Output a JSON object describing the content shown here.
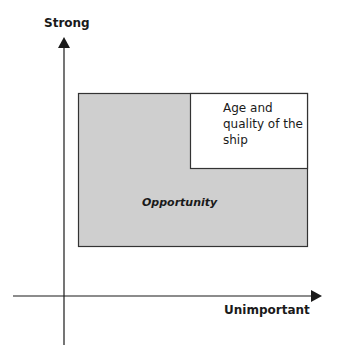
{
  "diagram": {
    "y_axis": {
      "label": "Strong"
    },
    "x_axis": {
      "label": "Unimportant"
    },
    "regions": [
      {
        "name": "opportunity",
        "label": "Opportunity",
        "fill": "#cfcfcf"
      },
      {
        "name": "age-quality",
        "label": "Age and quality of the ship",
        "fill": "#ffffff"
      }
    ],
    "colors": {
      "axis": "#1a1a1a",
      "border": "#333333"
    }
  }
}
